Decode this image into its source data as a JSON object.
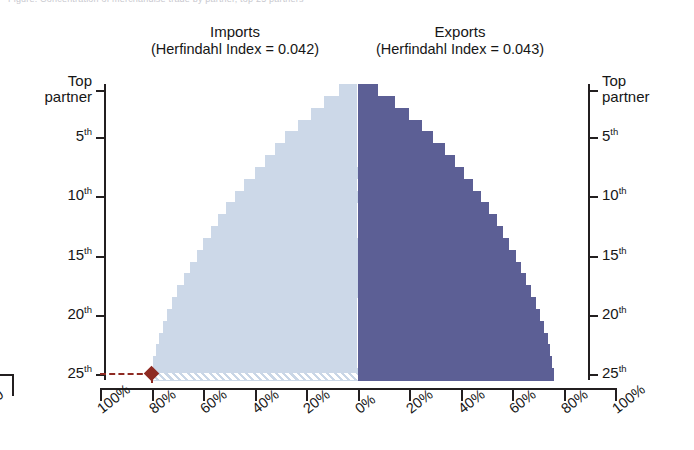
{
  "figure": {
    "clipped_header": "Figure: Concentration of merchandise trade by partner, top 25 partners",
    "panels": [
      {
        "name": "Imports",
        "metric_label": "(Herfindahl Index = 0.042)",
        "herfindahl_index": 0.042,
        "color": "#ccd8e8"
      },
      {
        "name": "Exports",
        "metric_label": "(Herfindahl Index = 0.043)",
        "herfindahl_index": 0.043,
        "color": "#5c5f95"
      }
    ],
    "annotation": {
      "label": "25th partner cumulative share marker",
      "side": "imports",
      "row": 25,
      "value_percent": 80,
      "color": "#8e2a22"
    },
    "neighbor_clip_label": "80"
  },
  "yaxis": {
    "ticks": [
      {
        "label": "Top partner",
        "rank": 1,
        "two_line": true
      },
      {
        "label": "5",
        "suffix": "th",
        "rank": 5,
        "two_line": false
      },
      {
        "label": "10",
        "suffix": "th",
        "rank": 10,
        "two_line": false
      },
      {
        "label": "15",
        "suffix": "th",
        "rank": 15,
        "two_line": false
      },
      {
        "label": "20",
        "suffix": "th",
        "rank": 20,
        "two_line": false
      },
      {
        "label": "25",
        "suffix": "th",
        "rank": 25,
        "two_line": false
      }
    ]
  },
  "xaxis": {
    "tick_labels": [
      "100%",
      "80%",
      "60%",
      "40%",
      "20%",
      "0%",
      "20%",
      "40%",
      "60%",
      "80%",
      "100%"
    ],
    "tick_values": [
      -100,
      -80,
      -60,
      -40,
      -20,
      0,
      20,
      40,
      60,
      80,
      100
    ]
  },
  "chart_data": {
    "type": "bar",
    "orientation": "horizontal-diverging",
    "title": "Concentration of merchandise trade by partner, top 25 partners",
    "xlabel": "",
    "ylabel": "Partner rank",
    "xlim": [
      -100,
      100
    ],
    "grid": false,
    "legend_position": "panel-titles",
    "categories": [
      "Top partner",
      "2nd",
      "3rd",
      "4th",
      "5th",
      "6th",
      "7th",
      "8th",
      "9th",
      "10th",
      "11th",
      "12th",
      "13th",
      "14th",
      "15th",
      "16th",
      "17th",
      "18th",
      "19th",
      "20th",
      "21st",
      "22nd",
      "23rd",
      "24th",
      "25th"
    ],
    "series": [
      {
        "name": "Imports",
        "metric_label": "(Herfindahl Index = 0.042)",
        "herfindahl_index": 0.042,
        "color": "#ccd8e8",
        "units": "cumulative % of total imports",
        "values": [
          7,
          13,
          18,
          23,
          28,
          32,
          36,
          40,
          44,
          47.5,
          51,
          54,
          57,
          60,
          62.5,
          65,
          67.5,
          70,
          72,
          74,
          75.5,
          77,
          78.3,
          79.3,
          80
        ]
      },
      {
        "name": "Exports",
        "metric_label": "(Herfindahl Index = 0.043)",
        "herfindahl_index": 0.043,
        "color": "#5c5f95",
        "units": "cumulative % of total exports",
        "values": [
          8,
          14.5,
          20,
          25,
          29.5,
          34,
          38,
          41.5,
          45,
          48,
          51,
          54,
          56.5,
          59,
          61.5,
          63.5,
          65.5,
          67.5,
          69.5,
          71,
          72.5,
          73.8,
          74.8,
          75.6,
          76.2
        ]
      }
    ],
    "annotations": [
      {
        "type": "marker-line",
        "series": "Imports",
        "category": "25th",
        "value": 80,
        "style": "dashed",
        "marker": "diamond",
        "color": "#8e2a22"
      },
      {
        "type": "hatched-band",
        "series": "Imports",
        "category": "25th",
        "description": "white diagonal hatch over final import row"
      }
    ]
  }
}
